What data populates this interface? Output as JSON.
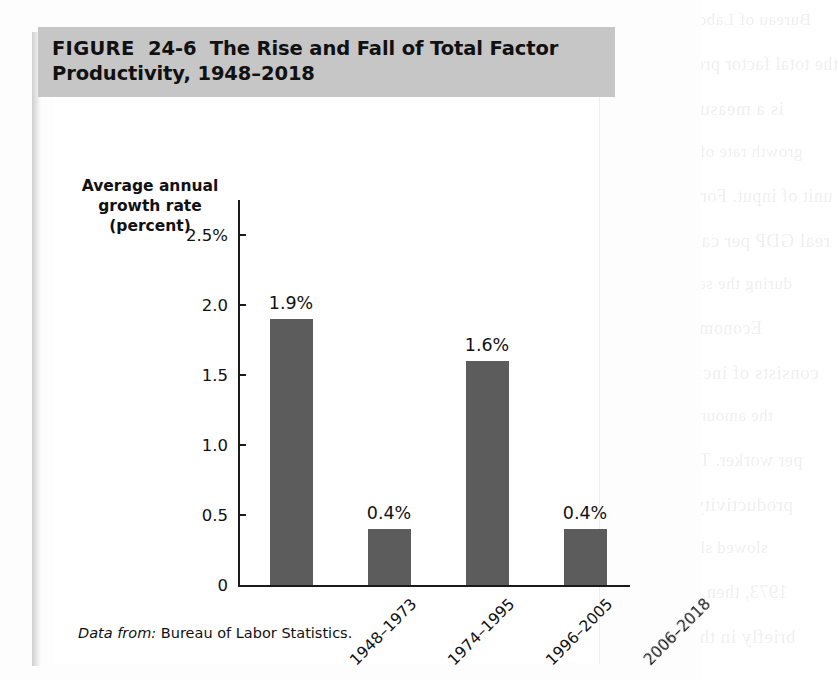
{
  "figure": {
    "label": "FIGURE",
    "number": "24-6",
    "title": "The Rise and Fall of Total Factor Productivity, 1948–2018",
    "title_full": "FIGURE  24-6  The Rise and Fall of Total Factor Productivity, 1948–2018",
    "source_lead": "Data from:",
    "source_text": "Bureau of Labor Statistics.",
    "title_bar_color": "#c6c6c6",
    "bar_color": "#5c5c5c",
    "axis_color": "#1b1b1b"
  },
  "chart_data": {
    "type": "bar",
    "title": "The Rise and Fall of Total Factor Productivity, 1948–2018",
    "categories": [
      "1948–1973",
      "1974–1995",
      "1996–2005",
      "2006–2018"
    ],
    "values": [
      1.9,
      0.4,
      1.6,
      0.4
    ],
    "data_labels": [
      "1.9%",
      "0.4%",
      "1.6%",
      "0.4%"
    ],
    "xlabel": "",
    "ylabel": "Average annual growth rate (percent)",
    "ylabel_lines": [
      "Average annual",
      "growth rate",
      "(percent)"
    ],
    "ylim": [
      0,
      2.75
    ],
    "yticks": [
      0,
      0.5,
      1.0,
      1.5,
      2.0,
      2.5
    ],
    "ytick_labels": [
      "0",
      "0.5",
      "1.0",
      "1.5",
      "2.0",
      "2.5%"
    ],
    "grid": false,
    "legend": false,
    "xtick_rotation": -45,
    "source": "Data from: Bureau of Labor Statistics."
  },
  "ghost_text": {
    "lines": [
      "Bureau of Labor Statistics",
      "the total factor productivity",
      "is a measure of the",
      "growth rate of output per",
      "unit of input. For example,",
      "real GDP per capita rose",
      "during the same period.",
      "Economic growth",
      "consists of increases in",
      "the amount produced",
      "per worker. The rate of",
      "productivity growth",
      "slowed sharply after",
      "1973, then recovered",
      "briefly in the 1990s."
    ]
  }
}
